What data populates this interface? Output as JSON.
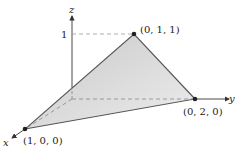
{
  "diagram": {
    "axes": {
      "x_label": "x",
      "y_label": "y",
      "z_label": "z",
      "z_tick_label": "1"
    },
    "vertices": [
      {
        "label": "(1, 0, 0)"
      },
      {
        "label": "(0, 2, 0)"
      },
      {
        "label": "(0, 1, 1)"
      }
    ],
    "colors": {
      "fill": "#d9d9d9",
      "edge": "#555555",
      "axis": "#333333",
      "point": "#222222",
      "dashed": "#888888"
    }
  }
}
